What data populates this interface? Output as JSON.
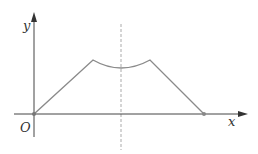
{
  "diagram": {
    "type": "function-graph",
    "labels": {
      "x_axis": "x",
      "y_axis": "y",
      "origin": "O"
    },
    "colors": {
      "axis": "#444444",
      "curve": "#8a8a8a",
      "dashed": "#aaaaaa",
      "point": "#777777"
    },
    "curve_description": "Rises linearly from O to a peak, dips in a concave arc symmetric about the dashed line, rises to a second equal peak, then falls linearly to the x-axis.",
    "symmetry_axis": "vertical dashed line"
  }
}
